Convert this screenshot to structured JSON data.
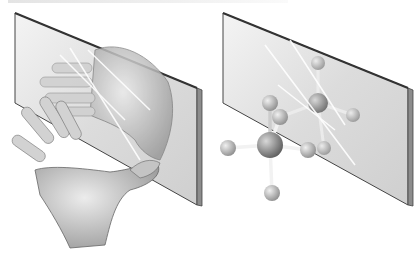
{
  "figure": {
    "caption_visible": "",
    "caption_note": "caption text cropped at top edge, illegible",
    "panels": [
      {
        "id": "hands",
        "subject": "left hand and its mirror reflection (right hand) against a mirror plane"
      },
      {
        "id": "molecule",
        "subject": "tetrahedral ball-and-stick molecule and its mirror image"
      }
    ],
    "colors": {
      "mirror_face": "#d9d9d9",
      "mirror_edge": "#555555",
      "skin": "#c8c8c8",
      "atom_center": "#8a8a8a",
      "atom_outer": "#b5b5b5"
    }
  }
}
